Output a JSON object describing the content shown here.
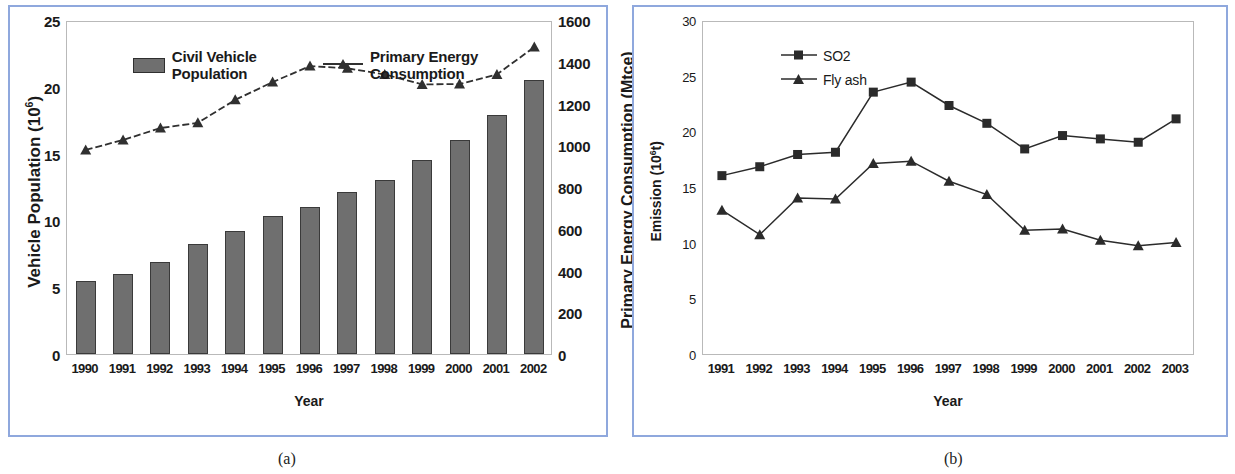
{
  "figure": {
    "caption_a": "(a)",
    "caption_b": "(b)"
  },
  "panel_a": {
    "xlabel": "Year",
    "ylabel_left_prefix": "Vehicle Population (10",
    "ylabel_left_sup": "6",
    "ylabel_left_suffix": ")",
    "ylabel_right": "Primary Energy Consumption (Mtce)",
    "legend": {
      "bar_label": "Civil Vehicle Population",
      "line_label": "Primary Energy Consumption"
    }
  },
  "panel_b": {
    "xlabel": "Year",
    "ylabel_prefix": "Emission (10",
    "ylabel_sup": "6",
    "ylabel_suffix": "t)",
    "legend": {
      "series1": "SO2",
      "series2": "Fly ash"
    }
  },
  "chart_data": [
    {
      "id": "a",
      "type": "bar",
      "title": "",
      "xlabel": "Year",
      "ylabel": "Vehicle Population (10^6)",
      "ylabel_secondary": "Primary Energy Consumption (Mtce)",
      "categories": [
        "1990",
        "1991",
        "1992",
        "1993",
        "1994",
        "1995",
        "1996",
        "1997",
        "1998",
        "1999",
        "2000",
        "2001",
        "2002"
      ],
      "ylim": [
        0,
        25
      ],
      "yticks": [
        0,
        5,
        10,
        15,
        20,
        25
      ],
      "ylim_secondary": [
        0,
        1600
      ],
      "yticks_secondary": [
        0,
        200,
        400,
        600,
        800,
        1000,
        1200,
        1400,
        1600
      ],
      "grid": false,
      "legend_position": "top",
      "series": [
        {
          "name": "Civil Vehicle Population",
          "kind": "bar",
          "axis": "left",
          "unit": "10^6",
          "color": "#6f6f6f",
          "values": [
            5.5,
            6.0,
            6.9,
            8.2,
            9.2,
            10.3,
            11.0,
            12.1,
            13.0,
            14.5,
            16.0,
            17.9,
            20.5
          ]
        },
        {
          "name": "Primary Energy Consumption",
          "kind": "line",
          "marker": "triangle",
          "axis": "right",
          "unit": "Mtce",
          "color": "#303030",
          "values": [
            987,
            1035,
            1092,
            1117,
            1227,
            1312,
            1389,
            1378,
            1349,
            1301,
            1303,
            1349,
            1480
          ]
        }
      ]
    },
    {
      "id": "b",
      "type": "line",
      "title": "",
      "xlabel": "Year",
      "ylabel": "Emission (10^6 t)",
      "categories": [
        "1991",
        "1992",
        "1993",
        "1994",
        "1995",
        "1996",
        "1997",
        "1998",
        "1999",
        "2000",
        "2001",
        "2002",
        "2003"
      ],
      "ylim": [
        0,
        30
      ],
      "yticks": [
        0,
        5,
        10,
        15,
        20,
        25,
        30
      ],
      "grid": false,
      "legend_position": "top-left",
      "series": [
        {
          "name": "SO2",
          "marker": "square",
          "color": "#2b2b2b",
          "values": [
            16.2,
            17.0,
            18.1,
            18.3,
            23.7,
            24.6,
            22.5,
            20.9,
            18.6,
            19.8,
            19.5,
            19.2,
            21.3
          ]
        },
        {
          "name": "Fly ash",
          "marker": "triangle",
          "color": "#2b2b2b",
          "values": [
            13.1,
            10.9,
            14.2,
            14.1,
            17.3,
            17.5,
            15.7,
            14.5,
            11.3,
            11.4,
            10.4,
            9.9,
            10.2
          ]
        }
      ]
    }
  ]
}
